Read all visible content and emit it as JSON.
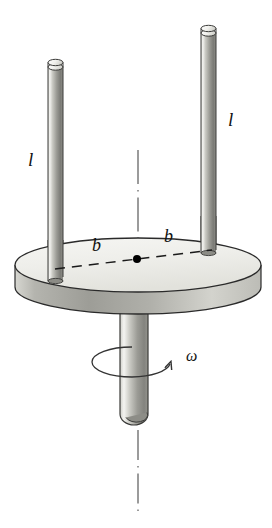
{
  "figure": {
    "type": "physics-diagram",
    "background_color": "#ffffff",
    "width": 272,
    "height": 528,
    "labels": {
      "rod_left_length": "l",
      "rod_right_length": "l",
      "radius_left": "b",
      "radius_right": "b",
      "angular_velocity": "ω"
    },
    "parts": {
      "disk": {
        "name": "disk",
        "fill_top": "#eeeeea",
        "fill_side": "#b6b6b0",
        "outline": "#2a2a2a",
        "center_x": 138,
        "top_ellipse_cy": 265,
        "rx": 123,
        "ry": 27,
        "thickness": 28
      },
      "rod_left": {
        "name": "rod-left",
        "x": 48,
        "width": 15,
        "top_y": 60,
        "bottom_y": 280,
        "fill_light": "#f2f2ef",
        "fill_dark": "#6f6f6b"
      },
      "rod_right": {
        "name": "rod-right",
        "x": 201,
        "width": 15,
        "top_y": 26,
        "bottom_y": 252,
        "fill_light": "#f2f2ef",
        "fill_dark": "#6f6f6b"
      },
      "shaft": {
        "name": "shaft",
        "x": 120,
        "width": 28,
        "top_y": 300,
        "bottom_y": 424,
        "fill_light": "#f4f4f1",
        "fill_dark": "#7a7a76"
      },
      "axis_line": {
        "name": "axis-of-rotation",
        "style": "dash-dot",
        "color": "#4a4a4a",
        "x": 138,
        "upper_from": 150,
        "upper_to": 268,
        "lower_from": 432,
        "lower_to": 516
      },
      "radius_line": {
        "name": "radius-dashed-line",
        "style": "dashed",
        "color": "#1a1a1a",
        "from_x": 55,
        "from_y": 268,
        "to_x": 212,
        "to_y": 250
      },
      "center_dot": {
        "name": "center-point",
        "x": 137,
        "y": 259,
        "r": 4,
        "color": "#000000"
      },
      "rotation_arrow": {
        "name": "rotation-direction-arrow",
        "color": "#333333",
        "cx": 132,
        "cy": 362,
        "rx": 40,
        "ry": 15
      }
    }
  }
}
